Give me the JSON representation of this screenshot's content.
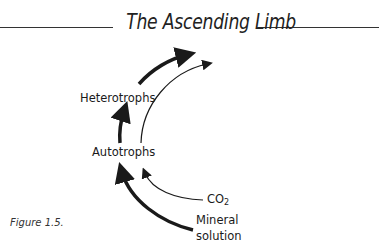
{
  "title": "The Ascending Limb",
  "nodes": {
    "heterotrophs": "Heterotrophs",
    "autotrophs": "Autotrophs",
    "co2": "CO",
    "co2_sub": "2",
    "mineral_line1": "Mineral",
    "mineral_line2": "solution"
  },
  "caption": "Figure 1.5.",
  "edges": [
    {
      "from": "Mineral solution",
      "to": "Autotrophs",
      "weight": "thick"
    },
    {
      "from": "CO2",
      "to": "Autotrophs",
      "weight": "thin"
    },
    {
      "from": "Autotrophs",
      "to": "Heterotrophs",
      "weight": "thick"
    },
    {
      "from": "Heterotrophs",
      "to": "beyond",
      "weight": "thick"
    },
    {
      "from": "Autotrophs",
      "to": "beyond",
      "weight": "thin"
    }
  ],
  "colors": {
    "ink": "#1a1a1a",
    "background": "#ffffff"
  }
}
